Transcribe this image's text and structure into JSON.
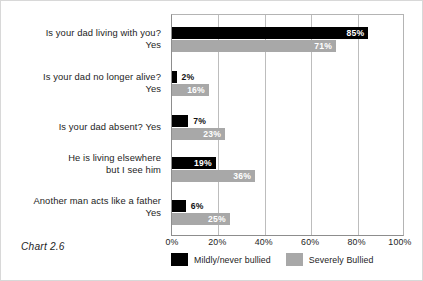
{
  "caption": "Chart 2.6",
  "chart_data": {
    "type": "bar",
    "orientation": "horizontal",
    "title": "",
    "subtitle": "",
    "xlabel": "",
    "ylabel": "",
    "xlim": [
      0,
      100
    ],
    "xticks": [
      0,
      20,
      40,
      60,
      80,
      100
    ],
    "xtick_labels": [
      "0%",
      "20%",
      "40%",
      "60%",
      "80%",
      "100%"
    ],
    "grid": "vertical",
    "legend_position": "bottom-left",
    "categories": [
      "Is your dad living with you?\nYes",
      "Is your dad no longer alive?\nYes",
      "Is your dad absent? Yes",
      "He is living elsewhere\nbut I see him",
      "Another man acts like a father\nYes"
    ],
    "category_lines": [
      [
        "Is your dad living with you?",
        "Yes"
      ],
      [
        "Is your dad no longer alive?",
        "Yes"
      ],
      [
        "Is your dad absent? Yes"
      ],
      [
        "He is living elsewhere",
        "but I see him"
      ],
      [
        "Another man acts like a father",
        "Yes"
      ]
    ],
    "series": [
      {
        "name": "Mildly/never bullied",
        "color": "#000000",
        "values": [
          85,
          2,
          7,
          19,
          6
        ],
        "labels": [
          "85%",
          "2%",
          "7%",
          "19%",
          "6%"
        ],
        "label_placement": [
          "inside",
          "outside",
          "outside",
          "inside",
          "outside"
        ]
      },
      {
        "name": "Severely Bullied",
        "color": "#a8a8a8",
        "values": [
          71,
          16,
          23,
          36,
          25
        ],
        "labels": [
          "71%",
          "16%",
          "23%",
          "36%",
          "25%"
        ],
        "label_placement": [
          "inside",
          "inside",
          "inside",
          "inside",
          "inside"
        ]
      }
    ]
  }
}
